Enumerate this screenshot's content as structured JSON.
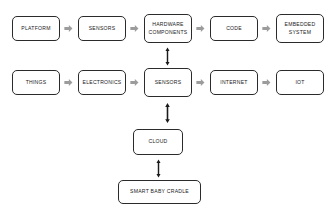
{
  "diagram": {
    "background_color": "#ffffff",
    "node_border_color": "#2b2b2b",
    "node_text_color": "#1a1a1a",
    "horizontal_arrow_color": "#9c9c9c",
    "vertical_arrow_color": "#1a1a1a",
    "rows": {
      "embedded_system_row": {
        "nodes": [
          {
            "id": "platform",
            "label": "PLATFORM"
          },
          {
            "id": "sensors-top",
            "label": "SENSORS"
          },
          {
            "id": "hardware-components",
            "label": "HARDWARE\nCOMPONENTS"
          },
          {
            "id": "code",
            "label": "CODE"
          },
          {
            "id": "embedded-system",
            "label": "EMBEDDED\nSYSTEM"
          }
        ],
        "connector_type": "block-arrow-right"
      },
      "iot_row": {
        "nodes": [
          {
            "id": "things",
            "label": "THINGS"
          },
          {
            "id": "electronics",
            "label": "ELECTRONICS"
          },
          {
            "id": "sensors-bottom",
            "label": "SENSORS"
          },
          {
            "id": "internet",
            "label": "INTERNET"
          },
          {
            "id": "iot",
            "label": "IOT"
          }
        ],
        "connector_type": "block-arrow-right"
      },
      "stack": {
        "nodes": [
          {
            "id": "cloud",
            "label": "CLOUD"
          },
          {
            "id": "smart-baby-cradle",
            "label": "SMART BABY CRADLE"
          }
        ],
        "connector_type": "double-headed-arrow-vertical"
      }
    },
    "vertical_connectors": [
      {
        "id": "hardware-to-sensors",
        "from": "hardware-components",
        "to": "sensors-bottom",
        "type": "double-headed"
      },
      {
        "id": "sensors-to-cloud",
        "from": "sensors-bottom",
        "to": "cloud",
        "type": "double-headed"
      },
      {
        "id": "cloud-to-cradle",
        "from": "cloud",
        "to": "smart-baby-cradle",
        "type": "double-headed"
      }
    ]
  }
}
